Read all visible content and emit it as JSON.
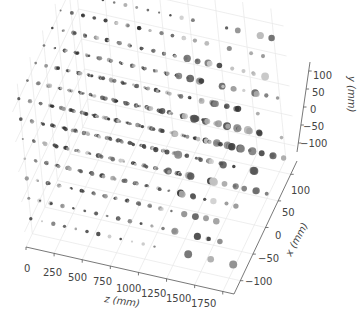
{
  "chart_data": {
    "type": "scatter3d",
    "title": "",
    "axes": {
      "z": {
        "label": "z (mm)",
        "range": [
          0,
          1850
        ],
        "ticks": [
          0,
          250,
          500,
          750,
          1000,
          1250,
          1500,
          1750
        ]
      },
      "x": {
        "label": "x (mm)",
        "range": [
          -125,
          125
        ],
        "ticks": [
          -100,
          -50,
          0,
          50,
          100
        ]
      },
      "y": {
        "label": "y (mm)",
        "range": [
          -125,
          125
        ],
        "ticks": [
          -100,
          -50,
          0,
          50,
          100
        ]
      }
    },
    "grid": true,
    "legend": null,
    "lattice": {
      "z_values": [
        0,
        100,
        200,
        300,
        400,
        500,
        600,
        700,
        800,
        900,
        1000,
        1100,
        1200,
        1300,
        1400,
        1500,
        1600,
        1700,
        1800
      ],
      "x_values": [
        -100,
        -66,
        -33,
        0,
        33,
        66,
        100
      ],
      "y_values": [
        -100,
        -66,
        -33,
        0,
        33,
        66,
        100
      ]
    },
    "marker_color": "#333333"
  },
  "labels": {
    "z_axis_title": "z (mm)",
    "x_axis_title": "x (mm)",
    "y_axis_title": "y (mm)",
    "z_ticks": [
      "0",
      "250",
      "500",
      "750",
      "1000",
      "1250",
      "1500",
      "1750"
    ],
    "x_ticks": [
      "-100",
      "-50",
      "0",
      "50",
      "100"
    ],
    "y_ticks": [
      "100",
      "50",
      "0",
      "-50",
      "-100"
    ]
  }
}
